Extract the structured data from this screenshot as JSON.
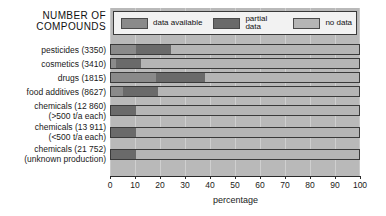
{
  "chart_data": {
    "type": "bar",
    "orientation": "horizontal",
    "stacked": true,
    "title": "NUMBER OF COMPOUNDS",
    "xlabel": "percentage",
    "ylabel": "",
    "xlim": [
      0,
      100
    ],
    "xticks": [
      0,
      10,
      20,
      30,
      40,
      50,
      60,
      70,
      80,
      90,
      100
    ],
    "grid": true,
    "legend_position": "top",
    "legend": [
      "data available",
      "partial data",
      "no data"
    ],
    "categories": [
      "pesticides (3350)",
      "cosmetics (3410)",
      "drugs (1815)",
      "food additives (8627)",
      "chemicals (12 860) (>500 t/a each)",
      "chemicals (13 911) (<500 t/a each)",
      "chemicals (21 752) (unknown production)"
    ],
    "series": [
      {
        "name": "data available",
        "values": [
          10,
          2,
          18,
          5,
          0,
          0,
          0
        ],
        "color": "#8a8a8a"
      },
      {
        "name": "partial data",
        "values": [
          14,
          10,
          20,
          14,
          10,
          10,
          10
        ],
        "color": "#6a6a6a"
      },
      {
        "name": "no data",
        "values": [
          76,
          88,
          62,
          81,
          90,
          90,
          90
        ],
        "color": "#b5b5b5"
      }
    ]
  },
  "header": {
    "title_line1": "NUMBER OF",
    "title_line2": "COMPOUNDS"
  },
  "legend": {
    "items": [
      {
        "label": "data available",
        "color": "#8a8a8a"
      },
      {
        "label": "partial data",
        "color": "#6a6a6a"
      },
      {
        "label": "no data",
        "color": "#b5b5b5"
      }
    ]
  },
  "rows": [
    {
      "line1": "pesticides (3350)",
      "line2": ""
    },
    {
      "line1": "cosmetics (3410)",
      "line2": ""
    },
    {
      "line1": "drugs (1815)",
      "line2": ""
    },
    {
      "line1": "food additives (8627)",
      "line2": ""
    },
    {
      "line1": "chemicals (12 860)",
      "line2": "(>500 t/a each)"
    },
    {
      "line1": "chemicals (13 911)",
      "line2": "(<500 t/a each)"
    },
    {
      "line1": "chemicals (21 752)",
      "line2": "(unknown production)"
    }
  ],
  "axis": {
    "title": "percentage",
    "ticks": [
      "0",
      "10",
      "20",
      "30",
      "40",
      "50",
      "60",
      "70",
      "80",
      "90",
      "100"
    ]
  }
}
